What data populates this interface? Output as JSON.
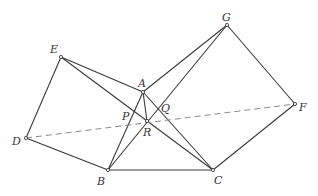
{
  "diagram": {
    "title": "",
    "colors": {
      "line": "#3a3a3a",
      "dashed": "#8a8a8a",
      "label": "#333333"
    },
    "points": {
      "A": {
        "x": 143,
        "y": 92,
        "label": "A",
        "lx": 138,
        "ly": 87
      },
      "B": {
        "x": 108,
        "y": 170,
        "label": "B",
        "lx": 97,
        "ly": 185
      },
      "C": {
        "x": 213,
        "y": 170,
        "label": "C",
        "lx": 214,
        "ly": 184
      },
      "D": {
        "x": 26,
        "y": 138,
        "label": "D",
        "lx": 12,
        "ly": 145
      },
      "E": {
        "x": 61,
        "y": 57,
        "label": "E",
        "lx": 50,
        "ly": 53
      },
      "F": {
        "x": 295,
        "y": 104,
        "label": "F",
        "lx": 299,
        "ly": 111
      },
      "G": {
        "x": 227,
        "y": 25,
        "label": "G",
        "lx": 222,
        "ly": 21
      },
      "P": {
        "x": 133,
        "y": 113,
        "label": "P",
        "lx": 122,
        "ly": 120
      },
      "Q": {
        "x": 159,
        "y": 109,
        "label": "Q",
        "lx": 161,
        "ly": 112
      },
      "R": {
        "x": 147,
        "y": 121,
        "label": "R",
        "lx": 143,
        "ly": 136
      }
    },
    "segments": [
      [
        "E",
        "D"
      ],
      [
        "D",
        "B"
      ],
      [
        "E",
        "A"
      ],
      [
        "A",
        "B"
      ],
      [
        "B",
        "C"
      ],
      [
        "A",
        "C"
      ],
      [
        "A",
        "G"
      ],
      [
        "G",
        "F"
      ],
      [
        "F",
        "C"
      ],
      [
        "E",
        "C"
      ],
      [
        "B",
        "G"
      ],
      [
        "A",
        "R"
      ]
    ],
    "dashed_segments": [
      [
        "D",
        "F"
      ]
    ],
    "vertex_markers": [
      "A",
      "B",
      "C",
      "D",
      "E",
      "F",
      "G",
      "R"
    ]
  }
}
